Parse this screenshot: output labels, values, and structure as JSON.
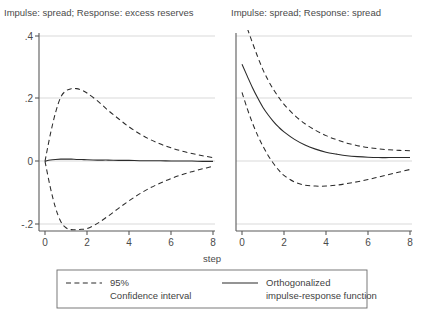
{
  "figure": {
    "xlabel": "step",
    "background": "#ffffff",
    "line_color": "#2b2b2b",
    "grid_color": "#c8c8c8",
    "axis_color": "#5a5a5a"
  },
  "legend": {
    "ci_label_line1": "95%",
    "ci_label_line2": "Confidence interval",
    "irf_label_line1": "Orthogonalized",
    "irf_label_line2": "impulse-response function",
    "ci_sample_style": "dashed",
    "irf_sample_style": "solid"
  },
  "panels": [
    {
      "title": "Impulse: spread; Response: excess reserves",
      "ytick_labels": [
        "-.2",
        "0",
        ".2",
        ".4"
      ],
      "xtick_labels": [
        "0",
        "2",
        "4",
        "6",
        "8"
      ]
    },
    {
      "title": "Impulse: spread; Response: spread",
      "ytick_labels": [
        "-.2",
        "0",
        ".2",
        ".4"
      ],
      "xtick_labels": [
        "0",
        "2",
        "4",
        "6",
        "8"
      ]
    }
  ],
  "chart_data": {
    "type": "line",
    "xlabel": "step",
    "ylabel": "",
    "xlim": [
      0,
      8
    ],
    "ylim": [
      -0.3,
      0.42
    ],
    "yticks": [
      -0.2,
      0,
      0.2,
      0.4
    ],
    "ytick_labels": [
      "-.2",
      "0",
      ".2",
      ".4"
    ],
    "xticks": [
      0,
      2,
      4,
      6,
      8
    ],
    "xtick_labels": [
      "0",
      "2",
      "4",
      "6",
      "8"
    ],
    "grid": "horizontal",
    "legend_position": "bottom",
    "panels": [
      {
        "title": "Impulse: spread; Response: excess reserves",
        "x": [
          0,
          0.25,
          0.5,
          0.75,
          1,
          1.25,
          1.5,
          1.75,
          2,
          2.5,
          3,
          3.5,
          4,
          4.5,
          5,
          5.5,
          6,
          6.5,
          7,
          7.5,
          8
        ],
        "series": [
          {
            "name": "Orthogonalized impulse-response function",
            "style": "solid",
            "values": [
              0.0,
              0.004,
              0.006,
              0.007,
              0.007,
              0.007,
              0.006,
              0.006,
              0.005,
              0.004,
              0.004,
              0.003,
              0.003,
              0.002,
              0.002,
              0.002,
              0.001,
              0.001,
              0.001,
              0.0,
              0.0
            ]
          },
          {
            "name": "95% Confidence interval upper",
            "style": "dashed",
            "values": [
              0.0,
              0.085,
              0.155,
              0.205,
              0.225,
              0.232,
              0.232,
              0.227,
              0.218,
              0.193,
              0.163,
              0.136,
              0.11,
              0.088,
              0.07,
              0.055,
              0.043,
              0.033,
              0.025,
              0.018,
              0.012
            ]
          },
          {
            "name": "95% Confidence interval lower",
            "style": "dashed",
            "values": [
              0.0,
              -0.082,
              -0.148,
              -0.192,
              -0.212,
              -0.218,
              -0.218,
              -0.217,
              -0.215,
              -0.198,
              -0.175,
              -0.15,
              -0.126,
              -0.104,
              -0.085,
              -0.069,
              -0.055,
              -0.043,
              -0.033,
              -0.024,
              -0.016
            ]
          }
        ]
      },
      {
        "title": "Impulse: spread; Response: spread",
        "x": [
          0,
          0.25,
          0.5,
          0.75,
          1,
          1.25,
          1.5,
          1.75,
          2,
          2.5,
          3,
          3.5,
          4,
          4.5,
          5,
          5.5,
          6,
          6.5,
          7,
          7.5,
          8
        ],
        "series": [
          {
            "name": "Orthogonalized impulse-response function",
            "style": "solid",
            "values": [
              0.31,
              0.272,
              0.235,
              0.202,
              0.172,
              0.148,
              0.127,
              0.109,
              0.094,
              0.07,
              0.052,
              0.039,
              0.029,
              0.023,
              0.018,
              0.015,
              0.013,
              0.012,
              0.012,
              0.012,
              0.012
            ]
          },
          {
            "name": "95% Confidence interval upper",
            "style": "dashed",
            "values": [
              0.475,
              0.425,
              0.378,
              0.333,
              0.292,
              0.258,
              0.229,
              0.204,
              0.182,
              0.147,
              0.12,
              0.099,
              0.082,
              0.069,
              0.058,
              0.05,
              0.044,
              0.04,
              0.037,
              0.035,
              0.034
            ]
          },
          {
            "name": "95% Confidence interval lower",
            "style": "dashed",
            "values": [
              0.22,
              0.168,
              0.122,
              0.082,
              0.048,
              0.018,
              -0.007,
              -0.028,
              -0.045,
              -0.066,
              -0.076,
              -0.079,
              -0.079,
              -0.076,
              -0.071,
              -0.065,
              -0.058,
              -0.05,
              -0.042,
              -0.034,
              -0.026
            ]
          }
        ]
      }
    ]
  }
}
